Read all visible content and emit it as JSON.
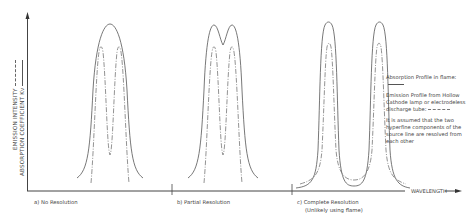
{
  "axes": {
    "y_label_1": "EMISSION INTENSITY",
    "y_label_2": "ABSORPTION COEFFICIENT Kν",
    "x_label": "WAVELENGTH"
  },
  "panels": [
    {
      "caption": "a)  No Resolution",
      "caption_line2": ""
    },
    {
      "caption": "b)  Partial Resolution",
      "caption_line2": ""
    },
    {
      "caption": "c)  Complete Resolution",
      "caption_line2": "(Unlikely using flame)"
    }
  ],
  "legend": {
    "absorption": "Absorption Profile in flame:",
    "emission": "Emission Profile from Hollow Cathode lamp or electrodeless discharge tube:",
    "note": "It is assumed that the two hyperfine components of the source line are resolved from each other"
  },
  "colors": {
    "line": "#555555",
    "dashed": "#777777",
    "background": "#ffffff"
  }
}
